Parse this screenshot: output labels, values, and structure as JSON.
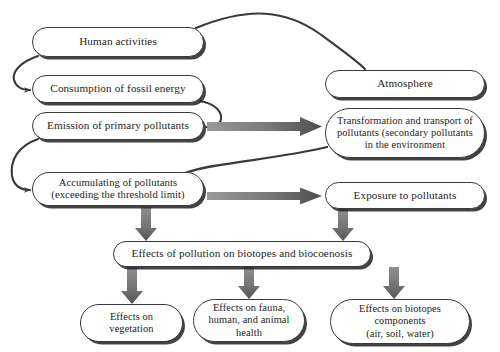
{
  "diagram": {
    "style": {
      "box_border_color": "#3a3a3a",
      "box_fill_color": "#ffffff",
      "box_shadow_color": "#282828",
      "thick_arrow_color": "#6e6e6e",
      "thick_arrow_dark_color": "#4a4a4a",
      "thin_curve_color": "#3a3a3a",
      "text_color": "#1d1d1d"
    },
    "nodes": [
      {
        "id": "human",
        "label": "Human activities"
      },
      {
        "id": "atmosphere",
        "label": "Atmosphere"
      },
      {
        "id": "consumption",
        "label": "Consumption of fossil energy"
      },
      {
        "id": "emission",
        "label": "Emission of primary pollutants"
      },
      {
        "id": "transform",
        "label": "Transformation and transport of\npollutants (secondary pollutants\nin the environment"
      },
      {
        "id": "accumulating",
        "label": "Accumulating of pollutants\n(exceeding the threshold limit)"
      },
      {
        "id": "exposure",
        "label": "Exposure to pollutants"
      },
      {
        "id": "effects_poll",
        "label": "Effects of pollution on biotopes and biocoenosis"
      },
      {
        "id": "vegetation",
        "label": "Effects on\nvegetation"
      },
      {
        "id": "fauna",
        "label": "Effects on fauna,\nhuman, and animal\nhealth"
      },
      {
        "id": "biotopes",
        "label": "Effects on biotopes\ncomponents\n(air, soil, water)"
      }
    ],
    "edges": [
      {
        "id": "e1",
        "from": "human",
        "to": "consumption",
        "style": "thin-curve"
      },
      {
        "id": "e2",
        "from": "human",
        "to": "atmosphere",
        "style": "thin-curve"
      },
      {
        "id": "e3",
        "from": "consumption",
        "to": "emission",
        "style": "thin-curve"
      },
      {
        "id": "e4",
        "from": "emission",
        "to": "transform",
        "style": "thick-arrow"
      },
      {
        "id": "e5",
        "from": "emission",
        "to": "accumulating",
        "style": "thin-curve"
      },
      {
        "id": "e6",
        "from": "transform",
        "to": "accumulating",
        "style": "thin-curve"
      },
      {
        "id": "e7",
        "from": "accumulating",
        "to": "exposure",
        "style": "thick-arrow"
      },
      {
        "id": "e8",
        "from": "accumulating",
        "to": "effects_poll",
        "style": "thick-arrow"
      },
      {
        "id": "e9",
        "from": "exposure",
        "to": "effects_poll",
        "style": "thick-arrow"
      },
      {
        "id": "e10",
        "from": "effects_poll",
        "to": "vegetation",
        "style": "thick-arrow"
      },
      {
        "id": "e11",
        "from": "effects_poll",
        "to": "fauna",
        "style": "thick-arrow"
      },
      {
        "id": "e12",
        "from": "effects_poll",
        "to": "biotopes",
        "style": "thick-arrow"
      }
    ]
  }
}
